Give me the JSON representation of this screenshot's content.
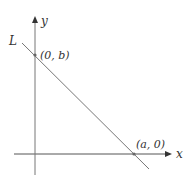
{
  "diagram": {
    "axes": {
      "x_label": "x",
      "y_label": "y"
    },
    "line": {
      "label": "L"
    },
    "points": [
      {
        "name": "y-intercept",
        "label": "(0, b)"
      },
      {
        "name": "x-intercept",
        "label": "(a, 0)"
      }
    ],
    "colors": {
      "axis": "#555555",
      "line": "#777777",
      "text": "#333333",
      "point": "#666666"
    }
  }
}
